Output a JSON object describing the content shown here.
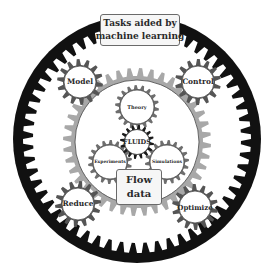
{
  "diagram": {
    "title_box": {
      "line1": "Tasks aided by",
      "line2": "machine learning"
    },
    "center": "FLUIDS",
    "inner_gears": [
      "Theory",
      "Experiments",
      "Simulations"
    ],
    "flow_box": {
      "line1": "Flow",
      "line2": "data"
    },
    "outer_gears": [
      "Model",
      "Control",
      "Reduce",
      "Optimize"
    ]
  },
  "colors": {
    "ring": "#111111",
    "outer_gear": "#555555",
    "middle_gear": "#a8a8a8",
    "inner_gear": "#6e6e6e",
    "center_gear": "#1a1a1a",
    "fill": "#ffffff",
    "box_bg": "#f6f6f6"
  }
}
